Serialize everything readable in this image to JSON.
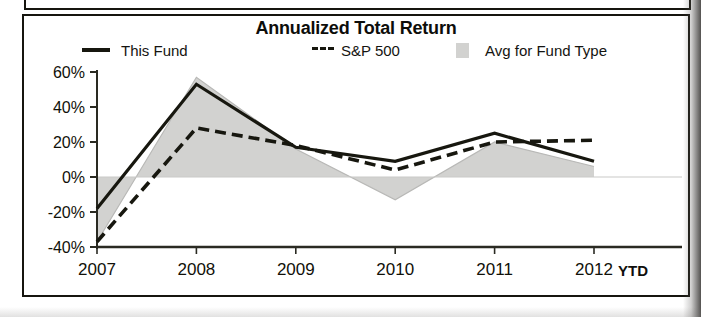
{
  "chart_data": {
    "type": "line",
    "title": "Annualized Total Return",
    "xlabel": "",
    "ylabel": "",
    "categories": [
      "2007",
      "2008",
      "2009",
      "2010",
      "2011",
      "2012"
    ],
    "x_axis_suffix_label": "YTD",
    "ytick_labels": [
      "60%",
      "40%",
      "20%",
      "0%",
      "-20%",
      "-40%"
    ],
    "yticks": [
      60,
      40,
      20,
      0,
      -20,
      -40
    ],
    "ylim": [
      -40,
      60
    ],
    "grid": false,
    "zero_line": true,
    "legend_position": "top",
    "series": [
      {
        "name": "This Fund",
        "style": "solid-line",
        "color": "#17170f",
        "values": [
          -18,
          53,
          17,
          9,
          25,
          9
        ]
      },
      {
        "name": "S&P 500",
        "style": "dashed-line",
        "color": "#17170f",
        "values": [
          -37,
          28,
          18,
          4,
          20,
          21
        ]
      },
      {
        "name": "Avg for Fund Type",
        "style": "filled-area",
        "color": "#d2d2d0",
        "values": [
          -37,
          57,
          16,
          -13,
          20,
          6
        ]
      }
    ]
  },
  "legend": {
    "items": [
      {
        "label": "This Fund",
        "marker": "solid-line-swatch"
      },
      {
        "label": "S&P 500",
        "marker": "dashed-line-swatch"
      },
      {
        "label": "Avg for Fund Type",
        "marker": "gray-area-swatch"
      }
    ]
  },
  "axis": {
    "y_labels": [
      "60%",
      "40%",
      "20%",
      "0%",
      "-20%",
      "-40%"
    ],
    "x_labels": [
      "2007",
      "2008",
      "2009",
      "2010",
      "2011",
      "2012"
    ],
    "ytd": "YTD"
  }
}
